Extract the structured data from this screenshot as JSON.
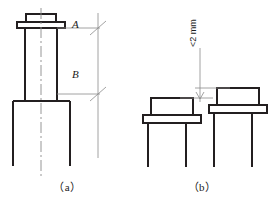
{
  "figure": {
    "type": "engineering-drawing",
    "background_color": "#ffffff",
    "line_color": "#231f20",
    "thin_line_color": "#6d6d6d",
    "width": 269,
    "height": 204
  },
  "panel_a": {
    "caption": "（a）",
    "description": "Sectional elevation of a flanged column with centerline and two dimension references",
    "dimension_labels": [
      {
        "id": "A",
        "text": "A",
        "position": "upper"
      },
      {
        "id": "B",
        "text": "B",
        "position": "lower"
      }
    ],
    "parts": {
      "top_plate": "top-flange-plate",
      "upper_cap": "upper-flange-cap",
      "shaft": "vertical-shaft",
      "base": "base-pedestal",
      "centerline": "vertical-centerline"
    }
  },
  "panel_b": {
    "caption": "（b）",
    "description": "Two adjacent flanged columns showing permissible height difference",
    "tolerance_label": "<2 mm",
    "columns": [
      {
        "id": "left",
        "label": "left-column",
        "relative_height": "lower"
      },
      {
        "id": "right",
        "label": "right-column",
        "relative_height": "higher"
      }
    ],
    "parts": {
      "body": "column-body",
      "flange": "column-flange-plate",
      "legs": "column-legs",
      "dimension_line": "height-difference-dimension"
    }
  }
}
